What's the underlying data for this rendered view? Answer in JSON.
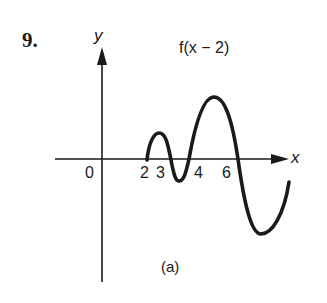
{
  "figure": {
    "problem_number": "9.",
    "function_label": "f(x − 2)",
    "caption": "(a)",
    "axes": {
      "x_label": "x",
      "y_label": "y",
      "origin_label": "0",
      "x_tick_labels": [
        "2",
        "3",
        "4",
        "6"
      ]
    },
    "colors": {
      "ink": "#1a1a1a",
      "background": "#ffffff"
    }
  }
}
